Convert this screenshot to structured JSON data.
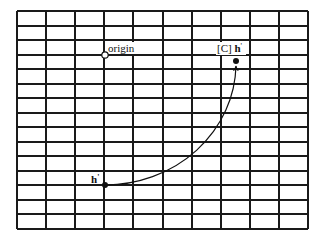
{
  "diagram": {
    "grid": {
      "left": 17,
      "top": 11,
      "right": 308,
      "bottom": 229,
      "columns": 10,
      "rows": 15,
      "line_color": "#1a1a1a"
    },
    "points": [
      {
        "id": "origin",
        "label": "origin",
        "x": 105,
        "y": 55,
        "style": "open-circle"
      },
      {
        "id": "h-prime",
        "label_main": "h",
        "label_mark": "'",
        "x": 105,
        "y": 185,
        "style": "filled-dot"
      },
      {
        "id": "c-h-prime",
        "label_prefix": "[C] ",
        "label_main": "h",
        "label_mark": "'",
        "x": 236,
        "y": 61,
        "style": "filled-dot"
      }
    ],
    "arrow": {
      "from": "h-prime",
      "to": "c-h-prime",
      "shape": "quarter-arc"
    }
  }
}
